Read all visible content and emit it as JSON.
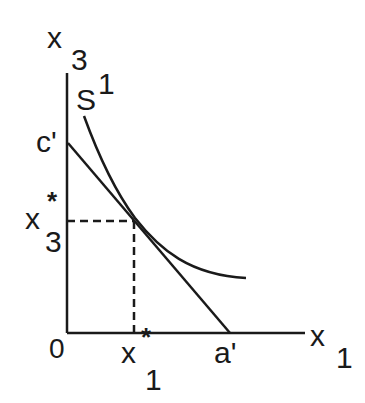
{
  "diagram": {
    "type": "indifference-curve-tangency",
    "axes": {
      "x_label": "x",
      "x_subscript": "1",
      "y_label": "x",
      "y_subscript": "3",
      "origin_label": "0"
    },
    "curve": {
      "label": "S",
      "superscript": "1"
    },
    "budget_line": {
      "y_intercept_label": "c'",
      "x_intercept_label": "a'"
    },
    "tangency": {
      "x_label": "x",
      "x_star": "*",
      "x_subscript": "1",
      "y_label": "x",
      "y_star": "*",
      "y_subscript": "3"
    },
    "colors": {
      "ink": "#1a1a1a",
      "background": "#ffffff"
    }
  }
}
